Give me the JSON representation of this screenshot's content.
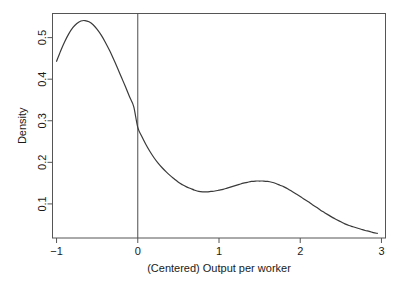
{
  "chart_data": {
    "type": "line",
    "title": "",
    "subtitle": "",
    "xlabel": "(Centered) Output per worker",
    "ylabel": "Density",
    "xlim": [
      -1.05,
      3.05
    ],
    "ylim": [
      0.018,
      0.558
    ],
    "xticks": [
      -1,
      0,
      1,
      2,
      3
    ],
    "xtick_labels": [
      "−1",
      "0",
      "1",
      "2",
      "3"
    ],
    "yticks": [
      0.1,
      0.2,
      0.3,
      0.4,
      0.5
    ],
    "ytick_labels": [
      "0.1",
      "0.2",
      "0.3",
      "0.4",
      "0.5"
    ],
    "grid": false,
    "legend": null,
    "series": [
      {
        "name": "density",
        "color": "#3a3a3a",
        "linewidth": 1.2,
        "x": [
          -1.0,
          -0.95,
          -0.9,
          -0.85,
          -0.8,
          -0.75,
          -0.7,
          -0.65,
          -0.6,
          -0.55,
          -0.5,
          -0.45,
          -0.4,
          -0.35,
          -0.3,
          -0.25,
          -0.2,
          -0.15,
          -0.1,
          -0.05,
          0.0,
          0.05,
          0.1,
          0.15,
          0.2,
          0.25,
          0.3,
          0.35,
          0.4,
          0.45,
          0.5,
          0.55,
          0.6,
          0.65,
          0.7,
          0.75,
          0.8,
          0.85,
          0.9,
          0.95,
          1.0,
          1.05,
          1.1,
          1.15,
          1.2,
          1.25,
          1.3,
          1.35,
          1.4,
          1.45,
          1.5,
          1.55,
          1.6,
          1.65,
          1.7,
          1.75,
          1.8,
          1.85,
          1.9,
          1.95,
          2.0,
          2.05,
          2.1,
          2.15,
          2.2,
          2.25,
          2.3,
          2.35,
          2.4,
          2.45,
          2.5,
          2.55,
          2.6,
          2.65,
          2.7,
          2.75,
          2.8,
          2.85,
          2.9,
          2.95
        ],
        "y": [
          0.443,
          0.468,
          0.49,
          0.509,
          0.524,
          0.534,
          0.54,
          0.541,
          0.538,
          0.531,
          0.52,
          0.506,
          0.489,
          0.47,
          0.449,
          0.427,
          0.404,
          0.381,
          0.357,
          0.334,
          0.284,
          0.262,
          0.243,
          0.226,
          0.211,
          0.198,
          0.187,
          0.177,
          0.168,
          0.16,
          0.152,
          0.146,
          0.141,
          0.137,
          0.133,
          0.13,
          0.129,
          0.129,
          0.13,
          0.131,
          0.133,
          0.135,
          0.138,
          0.141,
          0.144,
          0.147,
          0.15,
          0.152,
          0.154,
          0.155,
          0.155,
          0.155,
          0.154,
          0.152,
          0.149,
          0.145,
          0.141,
          0.136,
          0.13,
          0.124,
          0.118,
          0.111,
          0.105,
          0.098,
          0.092,
          0.085,
          0.079,
          0.073,
          0.067,
          0.062,
          0.057,
          0.052,
          0.048,
          0.045,
          0.042,
          0.039,
          0.036,
          0.034,
          0.031,
          0.029
        ],
        "annotation": "kernel density estimate, bimodal"
      }
    ],
    "reference_lines": [
      {
        "name": "zero-line",
        "orientation": "vertical",
        "x": 0,
        "color": "#4d4d4d",
        "linewidth": 1
      }
    ],
    "features": {
      "primary_mode_x": -0.65,
      "primary_mode_y": 0.541,
      "local_min_x": 0.82,
      "local_min_y": 0.129,
      "secondary_mode_x": 1.48,
      "secondary_mode_y": 0.155,
      "value_at_zero": 0.284,
      "left_endpoint_y": 0.443,
      "right_endpoint_y": 0.029
    }
  },
  "axes": {
    "frame_color": "#555555",
    "tick_color": "#555555",
    "text_color": "#1a1a1a"
  }
}
